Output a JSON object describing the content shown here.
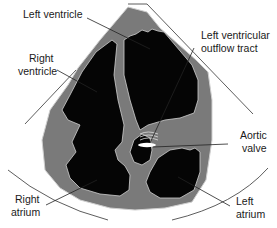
{
  "diagram": {
    "type": "echocardiogram-apical-five-chamber-view",
    "colors": {
      "background": "#ffffff",
      "myocardium": "#7a7a7a",
      "chamber": "#050505",
      "outline": "#d8d8d8",
      "leader": "#222222",
      "valve": "#ffffff"
    },
    "labels": {
      "left_ventricle": "Left ventricle",
      "right_ventricle_line1": "Right",
      "right_ventricle_line2": "ventricle",
      "lvot_line1": "Left ventricular",
      "lvot_line2": "outflow tract",
      "aortic_valve_line1": "Aortic",
      "aortic_valve_line2": "valve",
      "right_atrium_line1": "Right",
      "right_atrium_line2": "atrium",
      "left_atrium_line1": "Left",
      "left_atrium_line2": "atrium"
    }
  }
}
